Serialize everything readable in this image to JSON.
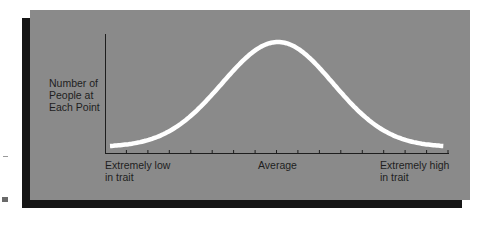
{
  "chart_data": {
    "type": "line",
    "title": "",
    "ylabel": "Number of People at Each Point",
    "xlabel": "",
    "x_tick_labels": [
      {
        "position": "left",
        "text": "Extremely low in trait"
      },
      {
        "position": "center",
        "text": "Average"
      },
      {
        "position": "right",
        "text": "Extremely high in trait"
      }
    ],
    "x_tick_count": 16,
    "y_ticks": [],
    "grid": false,
    "legend": null,
    "series": [
      {
        "name": "distribution",
        "shape": "normal",
        "mean": 0,
        "sd": 1,
        "x": [
          -3,
          -2.5,
          -2,
          -1.5,
          -1,
          -0.5,
          0,
          0.5,
          1,
          1.5,
          2,
          2.5,
          3
        ],
        "values": [
          0.011,
          0.044,
          0.135,
          0.325,
          0.607,
          0.882,
          1.0,
          0.882,
          0.607,
          0.325,
          0.135,
          0.044,
          0.011
        ]
      }
    ],
    "colors": {
      "panel": "#8a8a8a",
      "shadow": "#161616",
      "curve": "#ffffff",
      "axis": "#1e1e1e",
      "text": "#1e1e1e"
    }
  },
  "labels": {
    "ylabel_lines": [
      "Number of",
      "People at",
      "Each Point"
    ],
    "x_low_lines": [
      "Extremely low",
      "in trait"
    ],
    "x_avg": "Average",
    "x_high_lines": [
      "Extremely high",
      "in trait"
    ]
  }
}
